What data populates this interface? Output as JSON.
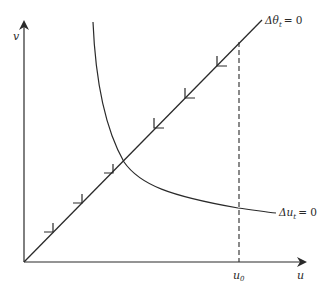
{
  "diagram": {
    "title": "",
    "axes": {
      "x_label": "u",
      "y_label": "v",
      "x_marker": {
        "label": "u",
        "subscript": "0"
      }
    },
    "curves": [
      {
        "id": "theta-locus",
        "label": "Δθ",
        "label_sub": "t",
        "label_eq": "= 0",
        "kind": "straight line through origin",
        "arrows_toward": "intersection"
      },
      {
        "id": "u-locus",
        "label": "Δu",
        "label_sub": "t",
        "label_eq": "= 0",
        "kind": "decreasing convex curve (hyperbola-like)"
      }
    ],
    "dashed_line": {
      "at": "u0",
      "from": "x-axis",
      "to": "theta-locus"
    },
    "colors": {
      "stroke": "#2a2a2a",
      "background": "#ffffff"
    }
  }
}
